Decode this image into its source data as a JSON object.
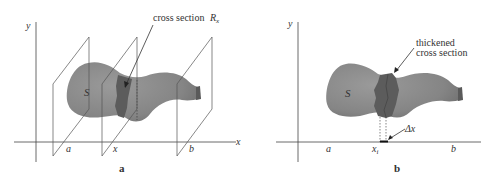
{
  "figure_a": {
    "caption": "a",
    "y_axis_label": "y",
    "x_axis_label": "x",
    "solid_label": "S",
    "annotation": "cross section",
    "annotation_symbol": "R",
    "annotation_subscript": "x",
    "tick_labels": [
      "a",
      "x",
      "b"
    ]
  },
  "figure_b": {
    "caption": "b",
    "y_axis_label": "y",
    "solid_label": "S",
    "annotation_line1": "thickened",
    "annotation_line2": "cross section",
    "delta_label": "Δx",
    "tick_labels": [
      "a",
      "x",
      "b"
    ],
    "tick_subscript": "i"
  },
  "colors": {
    "solid_fill": "#8a8a8a",
    "solid_shade": "#727272",
    "cross_section_fill": "#5c5c5c",
    "line": "#444444"
  }
}
